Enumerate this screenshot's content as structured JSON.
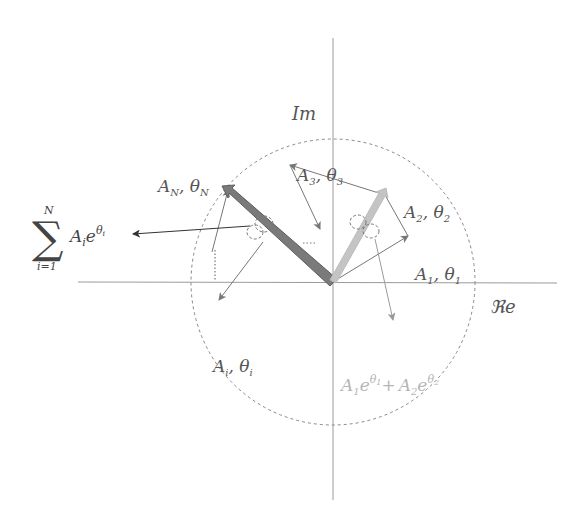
{
  "axes": {
    "imaginary_label": "Im",
    "real_label": "ℜe"
  },
  "phasors": {
    "sum_label": {
      "sigma": "∑",
      "upper": "N",
      "lower": "i=1",
      "term": "A",
      "term_sub": "i",
      "exp_base": "e",
      "exp": "θ",
      "exp_sub": "i"
    },
    "aN": {
      "a": "A",
      "a_sub": "N",
      "sep": ", ",
      "t": "θ",
      "t_sub": "N"
    },
    "a3": {
      "a": "A",
      "a_sub": "3",
      "sep": ", ",
      "t": "θ",
      "t_sub": "3"
    },
    "a2": {
      "a": "A",
      "a_sub": "2",
      "sep": ", ",
      "t": "θ",
      "t_sub": "2"
    },
    "a1": {
      "a": "A",
      "a_sub": "1",
      "sep": ", ",
      "t": "θ",
      "t_sub": "1"
    },
    "ai": {
      "a": "A",
      "a_sub": "i",
      "sep": ", ",
      "t": "θ",
      "t_sub": "i"
    },
    "partial_sum": {
      "a1": "A",
      "a1_sub": "1",
      "e1": "e",
      "t1": "θ",
      "t1_sub": "1",
      "plus": "+",
      "a2": "A",
      "a2_sub": "2",
      "e2": "e",
      "t2": "θ",
      "t2_sub": "2"
    }
  },
  "colors": {
    "axis": "#9a9a9a",
    "thin_arrow": "#777777",
    "resultant_dark": "#7a7a7a",
    "resultant_light": "#c4c4c4",
    "circle": "#888888",
    "light_text": "#b5b5b5"
  }
}
